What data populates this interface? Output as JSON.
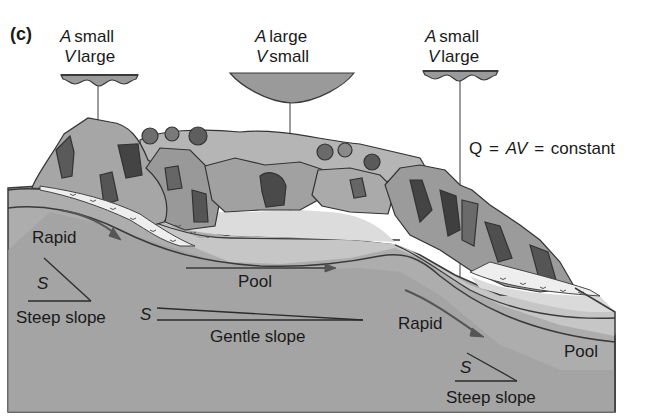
{
  "panel_label": "(c)",
  "cross_sections": [
    {
      "id": "left",
      "line1_var": "A",
      "line1_word": "small",
      "line2_var": "V",
      "line2_word": "large",
      "shape": "shallow-wide"
    },
    {
      "id": "center",
      "line1_var": "A",
      "line1_word": "large",
      "line2_var": "V",
      "line2_word": "small",
      "shape": "deep-wide"
    },
    {
      "id": "right",
      "line1_var": "A",
      "line1_word": "small",
      "line2_var": "V",
      "line2_word": "large",
      "shape": "shallow-wide"
    }
  ],
  "equation": {
    "q": "Q",
    "eq1": "=",
    "av": "AV",
    "eq2": "=",
    "constant": "constant"
  },
  "labels": {
    "rapid_left": "Rapid",
    "pool_center": "Pool",
    "rapid_right": "Rapid",
    "pool_right": "Pool",
    "steep_slope_left": "Steep slope",
    "gentle_slope": "Gentle slope",
    "steep_slope_right": "Steep slope",
    "s_symbol": "S"
  },
  "colors": {
    "ink": "#2b2b2b",
    "block_face": "#a9a9a9",
    "water_channel": "#c4c4c4",
    "pool_surface": "#d9d9d9",
    "rock": "#8e8e8e",
    "rock_dark": "#4a4a4a",
    "cross_section_fill": "#9a9a9a"
  }
}
